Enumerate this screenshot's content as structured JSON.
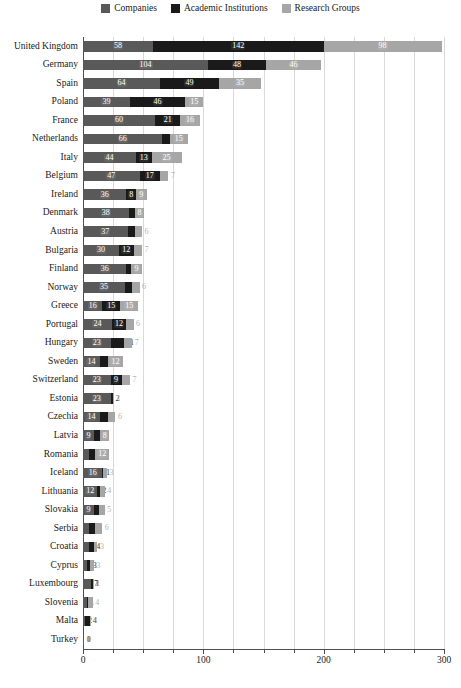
{
  "chart_data": {
    "type": "bar",
    "orientation": "horizontal",
    "stacked": true,
    "title": "",
    "xlabel": "",
    "ylabel": "",
    "xlim": [
      0,
      300
    ],
    "xticks": [
      0,
      100,
      200,
      300
    ],
    "xtick_labels": [
      "0",
      "100",
      "200",
      "300"
    ],
    "minor_xticks": [
      25,
      50,
      75,
      125,
      150,
      175,
      225,
      250,
      275
    ],
    "grid": true,
    "grid_axis": "x",
    "legend_position": "top-center",
    "legend": [
      "Companies",
      "Academic Institutions",
      "Research Groups"
    ],
    "colors": [
      "#595959",
      "#1a1a1a",
      "#a6a6a6"
    ],
    "categories": [
      "United Kingdom",
      "Germany",
      "Spain",
      "Poland",
      "France",
      "Netherlands",
      "Italy",
      "Belgium",
      "Ireland",
      "Denmark",
      "Austria",
      "Bulgaria",
      "Finland",
      "Norway",
      "Greece",
      "Portugal",
      "Hungary",
      "Sweden",
      "Switzerland",
      "Estonia",
      "Czechia",
      "Latvia",
      "Romania",
      "Iceland",
      "Lithuania",
      "Slovakia",
      "Serbia",
      "Croatia",
      "Cyprus",
      "Luxembourg",
      "Slovenia",
      "Malta",
      "Turkey"
    ],
    "series": [
      {
        "name": "Companies",
        "color": "#595959",
        "values": [
          58,
          104,
          64,
          39,
          60,
          66,
          44,
          47,
          36,
          38,
          37,
          30,
          36,
          35,
          16,
          24,
          23,
          14,
          23,
          23,
          14,
          9,
          5,
          16,
          12,
          9,
          5,
          5,
          3,
          7,
          3,
          2,
          1
        ]
      },
      {
        "name": "Academic Institutions",
        "color": "#1a1a1a",
        "values": [
          142,
          48,
          49,
          46,
          21,
          6,
          13,
          17,
          8,
          5,
          6,
          12,
          4,
          6,
          15,
          12,
          11,
          7,
          9,
          2,
          7,
          5,
          5,
          1,
          2,
          4,
          5,
          4,
          3,
          1,
          1,
          4,
          0
        ]
      },
      {
        "name": "Research Groups",
        "color": "#a6a6a6",
        "values": [
          98,
          46,
          35,
          15,
          16,
          15,
          25,
          7,
          9,
          8,
          6,
          7,
          9,
          6,
          15,
          6,
          7,
          12,
          7,
          1,
          6,
          8,
          12,
          3,
          4,
          5,
          6,
          3,
          3,
          1,
          4,
          1,
          0
        ]
      }
    ]
  }
}
